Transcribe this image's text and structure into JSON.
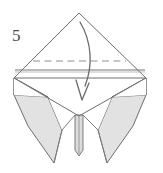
{
  "diagram": {
    "kind": "origami-fold-step",
    "step_number": "5",
    "canvas": {
      "width": 163,
      "height": 173
    },
    "colors": {
      "paper_front": "#ffffff",
      "paper_back_shaded": "#e2e2e2",
      "paper_back_shaded_dark": "#d5d5d5",
      "outline": "#6e6e6e",
      "crease_line": "#8c8c8c",
      "fold_dashed_line": "#9a9a9a",
      "arrow": "#6b6b6b",
      "step_label": "#4a4a4a",
      "background": "#ffffff"
    },
    "labels": {
      "step": "5"
    },
    "annotations": {
      "fold_line_style": "dashed",
      "fold_line_meaning": "valley-fold",
      "arrow_style": "curved-solid-with-open-arrowhead",
      "arrow_direction": "downward",
      "arrow_meaning": "fold top point down along dashed line"
    },
    "geometry": {
      "top_apex": {
        "x": 79,
        "y": 13
      },
      "left_corner": {
        "x": 14,
        "y": 78
      },
      "right_corner": {
        "x": 146,
        "y": 78
      },
      "horizontal_crease_y": 70,
      "dashed_fold_line": {
        "x1": 33,
        "y1": 61,
        "x2": 126,
        "y2": 61
      },
      "left_flap_tip": {
        "x": 54,
        "y": 163
      },
      "right_flap_tip": {
        "x": 107,
        "y": 163
      },
      "center_flap_tip": {
        "x": 79,
        "y": 156
      },
      "center_valley": {
        "x": 79,
        "y": 116
      },
      "arrow_start": {
        "x": 80,
        "y": 22
      },
      "arrow_end": {
        "x": 82,
        "y": 100
      }
    }
  }
}
